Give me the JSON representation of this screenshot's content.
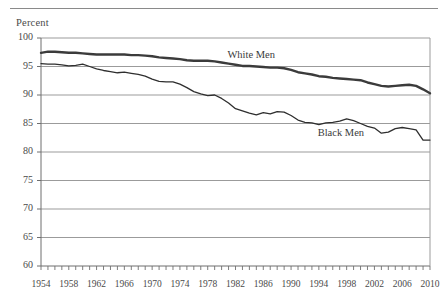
{
  "figure": {
    "axis_title": "Percent",
    "series_labels": {
      "white": "White Men",
      "black": "Black Men"
    }
  },
  "chart_data": {
    "type": "line",
    "title": "",
    "subtitle": "",
    "xlabel": "",
    "ylabel": "Percent",
    "xlim": [
      1954,
      2010
    ],
    "ylim": [
      60,
      100
    ],
    "ytick_values": [
      60,
      65,
      70,
      75,
      80,
      85,
      90,
      95,
      100
    ],
    "ytick_labels": [
      "60",
      "65",
      "70",
      "75",
      "80",
      "85",
      "90",
      "95",
      "100"
    ],
    "xtick_labels": [
      "1954",
      "1958",
      "1962",
      "1966",
      "1970",
      "1974",
      "1978",
      "1982",
      "1986",
      "1990",
      "1994",
      "1998",
      "2002",
      "2006",
      "2010"
    ],
    "xtick_values": [
      1954,
      1958,
      1962,
      1966,
      1970,
      1974,
      1978,
      1982,
      1986,
      1990,
      1994,
      1998,
      2002,
      2006,
      2010
    ],
    "minor_xticks_every": 1,
    "grid": "horizontal",
    "legend": "inline-annotations",
    "annotations": [
      {
        "text": "White Men",
        "x": 1984,
        "y": 96.8
      },
      {
        "text": "Black Men",
        "x": 1997,
        "y": 83.2
      }
    ],
    "x": [
      1954,
      1955,
      1956,
      1957,
      1958,
      1959,
      1960,
      1961,
      1962,
      1963,
      1964,
      1965,
      1966,
      1967,
      1968,
      1969,
      1970,
      1971,
      1972,
      1973,
      1974,
      1975,
      1976,
      1977,
      1978,
      1979,
      1980,
      1981,
      1982,
      1983,
      1984,
      1985,
      1986,
      1987,
      1988,
      1989,
      1990,
      1991,
      1992,
      1993,
      1994,
      1995,
      1996,
      1997,
      1998,
      1999,
      2000,
      2001,
      2002,
      2003,
      2004,
      2005,
      2006,
      2007,
      2008,
      2009,
      2010
    ],
    "series": [
      {
        "name": "White Men",
        "color": "#3b3b3b",
        "line_width": 2.4,
        "values": [
          97.4,
          97.6,
          97.6,
          97.5,
          97.4,
          97.4,
          97.3,
          97.2,
          97.1,
          97.1,
          97.1,
          97.1,
          97.1,
          97.0,
          97.0,
          96.9,
          96.8,
          96.6,
          96.5,
          96.4,
          96.3,
          96.1,
          96.0,
          96.0,
          96.0,
          95.9,
          95.7,
          95.5,
          95.3,
          95.1,
          95.1,
          95.0,
          94.9,
          94.8,
          94.8,
          94.7,
          94.4,
          94.0,
          93.8,
          93.6,
          93.3,
          93.2,
          93.0,
          92.9,
          92.8,
          92.7,
          92.6,
          92.2,
          91.9,
          91.6,
          91.5,
          91.6,
          91.7,
          91.8,
          91.6,
          91.0,
          90.3
        ]
      },
      {
        "name": "Black Men",
        "color": "#2e2e2e",
        "line_width": 1.3,
        "values": [
          95.5,
          95.4,
          95.4,
          95.3,
          95.1,
          95.2,
          95.4,
          95.0,
          94.6,
          94.3,
          94.1,
          93.9,
          94.0,
          93.8,
          93.6,
          93.3,
          92.8,
          92.4,
          92.3,
          92.3,
          91.9,
          91.3,
          90.6,
          90.2,
          89.9,
          90.0,
          89.4,
          88.6,
          87.6,
          87.2,
          86.8,
          86.5,
          86.9,
          86.7,
          87.1,
          87.0,
          86.4,
          85.6,
          85.2,
          85.1,
          84.8,
          85.1,
          85.2,
          85.4,
          85.8,
          85.5,
          85.0,
          84.5,
          84.2,
          83.3,
          83.5,
          84.1,
          84.3,
          84.1,
          83.9,
          82.1,
          82.1
        ]
      }
    ]
  }
}
